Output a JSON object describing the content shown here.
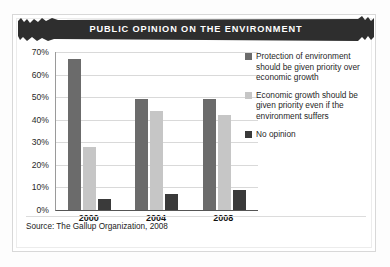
{
  "figure": {
    "title": "PUBLIC OPINION ON THE ENVIRONMENT",
    "source": "Source: The Gallup Organization, 2008"
  },
  "colors": {
    "series1": "#6b6b6b",
    "series2": "#c6c6c6",
    "series3": "#3a3a3a",
    "banner": "#2e2e2e",
    "banner_text": "#ffffff",
    "gridline": "#d9d9d9",
    "axis": "#555555",
    "card_border": "#d8d8d8"
  },
  "legend": {
    "position": "right",
    "items": [
      {
        "label": "Protection of environment should be given priority over economic growth",
        "color": "#6b6b6b"
      },
      {
        "label": "Economic growth should be given priority even if the environment suffers",
        "color": "#c6c6c6"
      },
      {
        "label": "No opinion",
        "color": "#3a3a3a"
      }
    ]
  },
  "chart_data": {
    "type": "bar",
    "title": "PUBLIC OPINION ON THE ENVIRONMENT",
    "xlabel": "",
    "ylabel": "",
    "categories": [
      "2000",
      "2004",
      "2008"
    ],
    "series": [
      {
        "name": "Protection of environment should be given priority over economic growth",
        "color": "#6b6b6b",
        "values": [
          67,
          49,
          49
        ]
      },
      {
        "name": "Economic growth should be given priority even if the environment suffers",
        "color": "#c6c6c6",
        "values": [
          28,
          44,
          42
        ]
      },
      {
        "name": "No opinion",
        "color": "#3a3a3a",
        "values": [
          5,
          7,
          9
        ]
      }
    ],
    "ylim": [
      0,
      70
    ],
    "ytick_values": [
      0,
      10,
      20,
      30,
      40,
      50,
      60,
      70
    ],
    "ytick_labels": [
      "0%",
      "10%",
      "20%",
      "30%",
      "40%",
      "50%",
      "60%",
      "70%"
    ],
    "grid": true,
    "legend_position": "right",
    "annotations": [
      "Source: The Gallup Organization, 2008"
    ]
  }
}
